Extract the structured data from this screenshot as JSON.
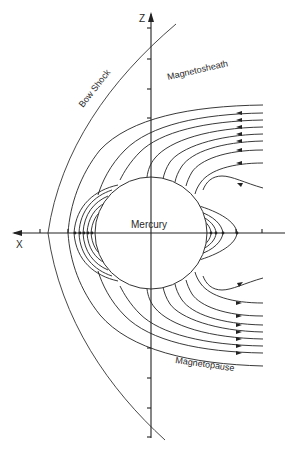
{
  "figure": {
    "labels": {
      "z_axis": "Z",
      "x_axis": "X",
      "bow_shock": "Bow Shock",
      "magnetosheath": "Magnetosheath",
      "planet": "Mercury",
      "magnetopause": "Magnetopause"
    },
    "colors": {
      "line": "#222222",
      "background": "#ffffff"
    }
  }
}
